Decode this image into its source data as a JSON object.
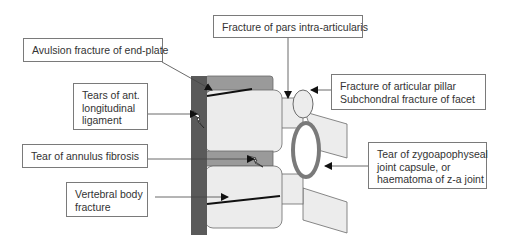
{
  "figure": {
    "type": "spinal injury schematic (lateral view of two vertebrae)",
    "labels": {
      "avulsion": {
        "lines": [
          "Avulsion fracture of end-plate"
        ]
      },
      "pars": {
        "lines": [
          "Fracture of pars intra-articularis"
        ]
      },
      "ant_ligament": {
        "lines": [
          "Tears of ant.",
          "longitudinal",
          "ligament"
        ]
      },
      "articular_pillar": {
        "lines": [
          "Fracture of articular pillar",
          "Subchondral fracture of  facet"
        ]
      },
      "annulus": {
        "lines": [
          "Tear of annulus fibrosis"
        ]
      },
      "zygoapophyseal": {
        "lines": [
          "Tear of zygoapophyseal",
          "joint capsule, or",
          "haematoma of z-a joint"
        ]
      },
      "vertebral_body": {
        "lines": [
          "Vertebral body",
          "fracture"
        ]
      }
    },
    "colors": {
      "ligament": "#5a5a5a",
      "endplate_disc": "#9a9a9a",
      "bone": "#ececec",
      "outline": "#6a6a6a",
      "arrow": "#111111",
      "fracture_line": "#111111"
    }
  }
}
